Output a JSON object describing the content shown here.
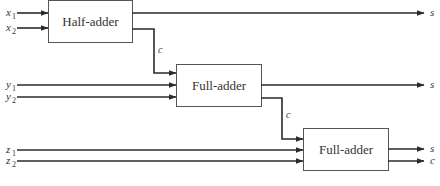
{
  "blocks": {
    "half_adder": {
      "label": "Half-adder"
    },
    "full_adder_1": {
      "label": "Full-adder"
    },
    "full_adder_2": {
      "label": "Full-adder"
    }
  },
  "inputs": [
    {
      "var": "x",
      "sub": "1"
    },
    {
      "var": "x",
      "sub": "2"
    },
    {
      "var": "y",
      "sub": "1"
    },
    {
      "var": "y",
      "sub": "2"
    },
    {
      "var": "z",
      "sub": "1"
    },
    {
      "var": "z",
      "sub": "2"
    }
  ],
  "outputs": {
    "half_adder_sum": "s",
    "full_adder_1_sum": "s",
    "full_adder_2_sum": "s",
    "full_adder_2_carry": "c"
  },
  "carries": {
    "ha_to_fa1": "c",
    "fa1_to_fa2": "c"
  },
  "colors": {
    "line": "#2a2a2a",
    "box_stroke": "#555555",
    "text": "#333333"
  }
}
